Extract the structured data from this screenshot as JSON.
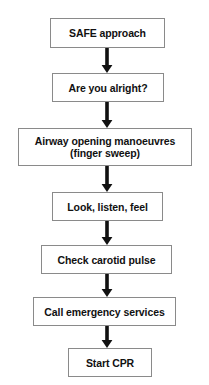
{
  "diagram": {
    "background_color": "#ffffff",
    "box_border_color": "#8a8a8a",
    "box_fill_color": "#ffffff",
    "text_color": "#111111",
    "arrow_color": "#111111",
    "nodes": [
      {
        "id": "safe-approach",
        "label": "SAFE approach",
        "x": 50,
        "y": 18,
        "width": 115,
        "height": 30
      },
      {
        "id": "are-you-alright",
        "label": "Are you alright?",
        "x": 52,
        "y": 73,
        "width": 112,
        "height": 29
      },
      {
        "id": "airway-opening-manoeuvres",
        "label": "Airway opening manoeuvres\n(finger sweep)",
        "x": 18,
        "y": 128,
        "width": 174,
        "height": 38
      },
      {
        "id": "look-listen-feel",
        "label": "Look, listen, feel",
        "x": 52,
        "y": 192,
        "width": 111,
        "height": 29
      },
      {
        "id": "check-carotid-pulse",
        "label": "Check carotid pulse",
        "x": 41,
        "y": 245,
        "width": 131,
        "height": 29
      },
      {
        "id": "call-emergency-services",
        "label": "Call emergency services",
        "x": 33,
        "y": 297,
        "width": 143,
        "height": 29
      },
      {
        "id": "start-cpr",
        "label": "Start CPR",
        "x": 68,
        "y": 348,
        "width": 84,
        "height": 29
      }
    ],
    "connectors": [
      {
        "id": "arrow-1",
        "from": "safe-approach",
        "to": "are-you-alright",
        "x": 100,
        "y": 48,
        "height": 25
      },
      {
        "id": "arrow-2",
        "from": "are-you-alright",
        "to": "airway-opening-manoeuvres",
        "x": 100,
        "y": 102,
        "height": 26
      },
      {
        "id": "arrow-3",
        "from": "airway-opening-manoeuvres",
        "to": "look-listen-feel",
        "x": 100,
        "y": 166,
        "height": 26
      },
      {
        "id": "arrow-4",
        "from": "look-listen-feel",
        "to": "check-carotid-pulse",
        "x": 100,
        "y": 221,
        "height": 24
      },
      {
        "id": "arrow-5",
        "from": "check-carotid-pulse",
        "to": "call-emergency-services",
        "x": 100,
        "y": 274,
        "height": 23
      },
      {
        "id": "arrow-6",
        "from": "call-emergency-services",
        "to": "start-cpr",
        "x": 100,
        "y": 326,
        "height": 22
      }
    ]
  }
}
